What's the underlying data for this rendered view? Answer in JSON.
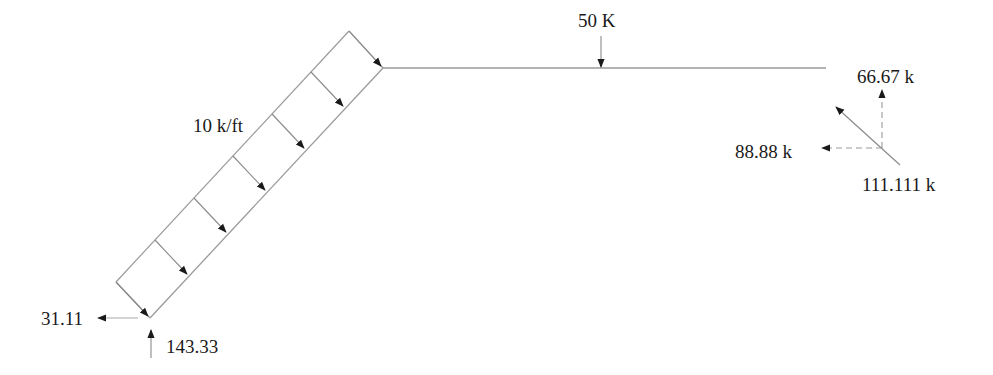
{
  "diagram": {
    "type": "free-body-diagram",
    "labels": {
      "distributed_load": "10 k/ft",
      "point_load": "50 K",
      "reaction_vertical_right": "66.67 k",
      "reaction_horizontal_right": "88.88 k",
      "reaction_resultant_right": "111.111 k",
      "reaction_horizontal_left": "31.11",
      "reaction_vertical_left": "143.33"
    },
    "colors": {
      "member_line": "#9a9a9a",
      "arrow": "#1a1a1a",
      "text": "#1a1a1a",
      "background": "#ffffff"
    }
  }
}
